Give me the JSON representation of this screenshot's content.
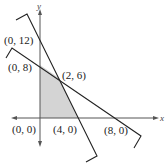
{
  "figure": {
    "axes": {
      "x_label": "x",
      "y_label": "y"
    },
    "points": [
      {
        "label": "(0, 12)",
        "x": 0,
        "y": 12
      },
      {
        "label": "(0, 8)",
        "x": 0,
        "y": 8
      },
      {
        "label": "(2, 6)",
        "x": 2,
        "y": 6
      },
      {
        "label": "(0, 0)",
        "x": 0,
        "y": 0
      },
      {
        "label": "(4, 0)",
        "x": 4,
        "y": 0
      },
      {
        "label": "(8, 0)",
        "x": 8,
        "y": 0
      }
    ],
    "lines": [
      {
        "name": "steep line",
        "through": [
          "(0, 12)",
          "(4, 0)"
        ],
        "equation": "3x + y = 12"
      },
      {
        "name": "shallow line",
        "through": [
          "(0, 8)",
          "(8, 0)"
        ],
        "equation": "x + y = 8"
      }
    ],
    "shaded_region": {
      "vertices": [
        "(0, 0)",
        "(0, 8)",
        "(2, 6)",
        "(4, 0)"
      ],
      "color": "#d4d4d4"
    },
    "colors": {
      "line": "#222222",
      "axis": "#555555",
      "shade": "#d4d4d4"
    }
  }
}
